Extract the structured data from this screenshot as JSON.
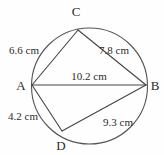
{
  "figure": {
    "kind": "cyclic-quadrilateral-in-circle",
    "background_color": "#fefefe",
    "stroke_color": "#555555",
    "text_color": "#2b2b2b",
    "circle": {
      "center_x": 89.5,
      "center_y": 86,
      "radius": 58
    },
    "vertices": [
      {
        "id": "C",
        "label": "C",
        "x": 78,
        "y": 30,
        "label_x": 76,
        "label_y": 16
      },
      {
        "id": "A",
        "label": "A",
        "x": 32,
        "y": 85,
        "label_x": 21,
        "label_y": 90
      },
      {
        "id": "B",
        "label": "B",
        "x": 146,
        "y": 85,
        "label_x": 155,
        "label_y": 90
      },
      {
        "id": "D",
        "label": "D",
        "x": 62,
        "y": 131,
        "label_x": 61,
        "label_y": 150
      }
    ],
    "segments": [
      {
        "id": "AC",
        "from": "A",
        "to": "C",
        "x1": 32,
        "y1": 85,
        "x2": 78,
        "y2": 30
      },
      {
        "id": "CB",
        "from": "C",
        "to": "B",
        "x1": 78,
        "y1": 30,
        "x2": 146,
        "y2": 85
      },
      {
        "id": "AB",
        "from": "A",
        "to": "B",
        "x1": 32,
        "y1": 85,
        "x2": 146,
        "y2": 85
      },
      {
        "id": "AD",
        "from": "A",
        "to": "D",
        "x1": 32,
        "y1": 85,
        "x2": 62,
        "y2": 131
      },
      {
        "id": "DB",
        "from": "D",
        "to": "B",
        "x1": 62,
        "y1": 131,
        "x2": 146,
        "y2": 85
      }
    ],
    "measurements": [
      {
        "id": "AC",
        "value": "6.6 cm",
        "x": 9,
        "y": 54,
        "anchor": "start"
      },
      {
        "id": "CB",
        "value": "7.8 cm",
        "x": 99,
        "y": 54,
        "anchor": "start"
      },
      {
        "id": "AB",
        "value": "10.2 cm",
        "x": 89,
        "y": 80,
        "anchor": "middle"
      },
      {
        "id": "AD",
        "value": "4.2 cm",
        "x": 8,
        "y": 120,
        "anchor": "start"
      },
      {
        "id": "DB",
        "value": "9.3 cm",
        "x": 103,
        "y": 126,
        "anchor": "start"
      }
    ]
  }
}
